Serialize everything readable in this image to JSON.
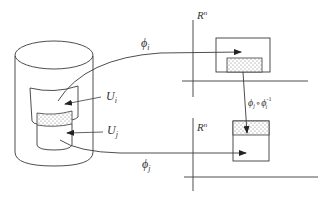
{
  "labels": {
    "phi_i": "ϕ",
    "phi_i_sub": "i",
    "phi_j": "ϕ",
    "phi_j_sub": "j",
    "U_i": "U",
    "U_i_sub": "i",
    "U_j": "U",
    "U_j_sub": "j",
    "Rn_top": "R",
    "Rn_top_sup": "n",
    "Rn_bottom": "R",
    "Rn_bottom_sup": "n",
    "transition_phi_j": "ϕ",
    "transition_phi_j_sub": "j",
    "transition_circ": "∘",
    "transition_phi_i": "ϕ",
    "transition_phi_i_sub": "i",
    "transition_phi_i_sup": "-1"
  },
  "colors": {
    "stroke": "#3a3a3a",
    "dots": "#777777",
    "background": "#ffffff"
  }
}
